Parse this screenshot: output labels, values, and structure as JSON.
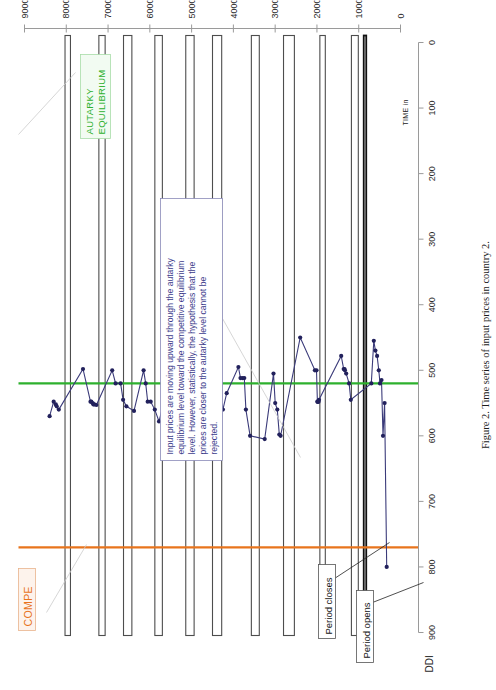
{
  "figure": {
    "caption": "Figure 2.  Time series of input prices in country 2.",
    "rotation": "page is rotated 90 degrees (landscape figure on portrait page)"
  },
  "axes": {
    "value_axis": {
      "title": "DDI",
      "min": 0,
      "max": 900,
      "ticks": [
        0,
        100,
        200,
        300,
        400,
        500,
        600,
        700,
        800,
        900
      ],
      "tick_labels": [
        "0",
        "100",
        "200",
        "300",
        "400",
        "500",
        "600",
        "700",
        "800",
        "900"
      ]
    },
    "time_axis": {
      "title": "TIME in",
      "min": 0,
      "max": 9000,
      "ticks": [
        0,
        1000,
        2000,
        3000,
        4000,
        5000,
        6000,
        7000,
        8000,
        9000
      ],
      "tick_labels": [
        "0",
        "1000",
        "2000",
        "3000",
        "4000",
        "5000",
        "6000",
        "7000",
        "8000",
        "9000"
      ]
    }
  },
  "reference_lines": [
    {
      "name": "competitive-equilibrium-line",
      "label": "COMPE",
      "value": 770,
      "color": "#e8741c"
    },
    {
      "name": "autarky-equilibrium-line",
      "label": "AUTARKY\nEQUILIBRIUM",
      "label_line1": "AUTARKY",
      "label_line2": "EQUILIBRIUM",
      "value": 520,
      "color": "#2db02d"
    }
  ],
  "annotations": {
    "period_closes": "Period closes",
    "period_opens": "Period opens",
    "callout": {
      "lines": [
        "Input prices are moving upward  through the autarky",
        "equilibrium level toward the competitive equilibrium",
        "level. However, statistically, the hypothesis that the",
        "prices are closer to the autarky level cannot be",
        "rejected."
      ]
    }
  },
  "chart_data": {
    "type": "scatter",
    "title": "Time series of input prices in country 2",
    "xlabel": "TIME in",
    "ylabel": "DDI",
    "xlim": [
      0,
      9000
    ],
    "ylim": [
      0,
      900
    ],
    "grid": false,
    "legend": "none",
    "series": [
      {
        "name": "input-price",
        "color": "#22215c",
        "x": [
          330,
          380,
          420,
          455,
          490,
          520,
          560,
          600,
          640,
          700,
          1190,
          1230,
          1300,
          1330,
          1340,
          1360,
          1420,
          1950,
          1960,
          1975,
          1985,
          1990,
          2010,
          2050,
          2400,
          2870,
          2900,
          2950,
          3000,
          3040,
          3250,
          3600,
          3700,
          3740,
          3780,
          3830,
          3880,
          4160,
          4250,
          4400,
          4460,
          4700,
          4800,
          4840,
          4870,
          4900,
          4960,
          5150,
          5250,
          5320,
          5400,
          5430,
          5470,
          5780,
          5880,
          5980,
          6050,
          6100,
          6150,
          6380,
          6560,
          6640,
          6700,
          6820,
          6900,
          7280,
          7330,
          7350,
          7370,
          7400,
          7420,
          7600,
          8180,
          8230,
          8250,
          8300,
          8400
        ],
        "y": [
          800,
          550,
          600,
          515,
          520,
          500,
          478,
          470,
          455,
          520,
          545,
          520,
          505,
          500,
          498,
          498,
          478,
          545,
          548,
          548,
          548,
          548,
          500,
          500,
          450,
          600,
          598,
          560,
          550,
          505,
          605,
          600,
          560,
          512,
          512,
          512,
          495,
          535,
          560,
          520,
          512,
          550,
          552,
          538,
          535,
          528,
          520,
          600,
          575,
          548,
          545,
          522,
          500,
          578,
          560,
          548,
          548,
          520,
          500,
          562,
          555,
          545,
          520,
          520,
          500,
          553,
          552,
          552,
          550,
          548,
          548,
          498,
          560,
          555,
          552,
          548,
          570
        ]
      }
    ]
  },
  "period_bands": [
    {
      "start": 820,
      "end": 880,
      "strong": true
    },
    {
      "start": 1010,
      "end": 1175
    },
    {
      "start": 1800,
      "end": 1930
    },
    {
      "start": 2540,
      "end": 2800
    },
    {
      "start": 3380,
      "end": 3570
    },
    {
      "start": 4280,
      "end": 4500
    },
    {
      "start": 4940,
      "end": 5140
    },
    {
      "start": 5700,
      "end": 5880
    },
    {
      "start": 6430,
      "end": 6630
    },
    {
      "start": 7070,
      "end": 7220
    },
    {
      "start": 7900,
      "end": 8030
    }
  ]
}
